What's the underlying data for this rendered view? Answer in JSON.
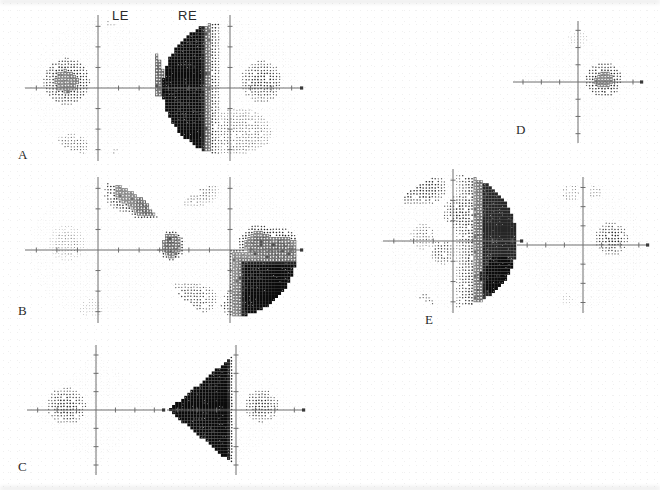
{
  "figure": {
    "type": "visual-field-greyscale-grid",
    "background": "#ffffff",
    "ink": "#1a1a1a",
    "column_headers": [
      {
        "label": "LE",
        "x": 112,
        "y": 8
      },
      {
        "label": "RE",
        "x": 178,
        "y": 8
      }
    ],
    "panels": [
      {
        "id": "A",
        "letter": "A",
        "letter_x": 18,
        "letter_y": 147,
        "fields": [
          {
            "eye": "LE",
            "x": 24,
            "y": 14,
            "w": 148,
            "h": 148,
            "shape": "round",
            "overall": "near-normal",
            "blind_spot": {
              "cx": -14,
              "cy": -3,
              "r": 9,
              "level": 7
            },
            "defects": [
              {
                "kind": "patch",
                "cx": -12,
                "cy": 26,
                "rx": 7,
                "ry": 5,
                "level": 4
              },
              {
                "kind": "band",
                "x0": 26,
                "x1": 32,
                "y0": -16,
                "y1": 4,
                "level": 8
              },
              {
                "kind": "speck",
                "cx": 8,
                "cy": 28,
                "r": 2,
                "level": 3
              },
              {
                "kind": "speck",
                "cx": 6,
                "cy": -29,
                "r": 2,
                "level": 3
              }
            ]
          },
          {
            "eye": "RE",
            "x": 156,
            "y": 14,
            "w": 148,
            "h": 148,
            "shape": "round",
            "overall": "dense-temporal-hemianopia",
            "blind_spot": {
              "cx": 14,
              "cy": -3,
              "r": 8,
              "level": 6
            },
            "defects": [
              {
                "kind": "hemi",
                "side": "left",
                "edge": -4,
                "level": 10,
                "feather": 9
              },
              {
                "kind": "patch",
                "cx": 4,
                "cy": 20,
                "rx": 13,
                "ry": 10,
                "level": 4
              },
              {
                "kind": "speck",
                "cx": -9,
                "cy": -29,
                "r": 4,
                "level": 6
              }
            ]
          }
        ]
      },
      {
        "id": "B",
        "letter": "B",
        "letter_x": 18,
        "letter_y": 303,
        "fields": [
          {
            "eye": "LE",
            "x": 24,
            "y": 176,
            "w": 148,
            "h": 148,
            "shape": "round",
            "overall": "inferior-temporal-defect",
            "blind_spot": {
              "cx": -14,
              "cy": -3,
              "r": 7,
              "level": 3
            },
            "defects": [
              {
                "kind": "patch",
                "cx": 16,
                "cy": -26,
                "rx": 12,
                "ry": 9,
                "level": 7
              },
              {
                "kind": "patch",
                "cx": 22,
                "cy": -20,
                "rx": 8,
                "ry": 6,
                "level": 8
              },
              {
                "kind": "speck",
                "cx": -3,
                "cy": 27,
                "r": 5,
                "level": 2
              }
            ]
          },
          {
            "eye": "RE",
            "x": 156,
            "y": 176,
            "w": 148,
            "h": 148,
            "shape": "round",
            "overall": "inferior-and-nasal-quadrant-loss",
            "blind_spot": {
              "cx": 13,
              "cy": -2,
              "r": 8,
              "level": 8
            },
            "defects": [
              {
                "kind": "quad",
                "qx": "right",
                "qy": "bottom",
                "level": 10
              },
              {
                "kind": "patch",
                "cx": 22,
                "cy": 6,
                "rx": 13,
                "ry": 14,
                "level": 8
              },
              {
                "kind": "patch",
                "cx": 14,
                "cy": 24,
                "rx": 16,
                "ry": 9,
                "level": 7
              },
              {
                "kind": "patch",
                "cx": -18,
                "cy": 22,
                "rx": 11,
                "ry": 7,
                "level": 5
              },
              {
                "kind": "patch",
                "cx": -26,
                "cy": -2,
                "rx": 5,
                "ry": 6,
                "level": 8
              },
              {
                "kind": "patch",
                "cx": -16,
                "cy": -26,
                "rx": 10,
                "ry": 6,
                "level": 4
              }
            ]
          }
        ]
      },
      {
        "id": "C",
        "letter": "C",
        "letter_x": 18,
        "letter_y": 459,
        "fields": [
          {
            "eye": "LE",
            "x": 26,
            "y": 344,
            "w": 140,
            "h": 132,
            "shape": "diamond",
            "overall": "normal",
            "blind_spot": {
              "cx": -14,
              "cy": -2,
              "r": 8,
              "level": 6
            },
            "defects": []
          },
          {
            "eye": "RE",
            "x": 166,
            "y": 344,
            "w": 140,
            "h": 132,
            "shape": "diamond",
            "overall": "dense-temporal-hemianopia",
            "blind_spot": {
              "cx": 12,
              "cy": -2,
              "r": 7,
              "level": 6
            },
            "defects": [
              {
                "kind": "hemi",
                "side": "left",
                "edge": -1,
                "level": 10,
                "feather": 3
              }
            ]
          }
        ]
      },
      {
        "id": "D",
        "letter": "D",
        "letter_x": 516,
        "letter_y": 122,
        "fields": [
          {
            "eye": "RE",
            "x": 512,
            "y": 20,
            "w": 132,
            "h": 124,
            "shape": "diamond",
            "overall": "normal",
            "blind_spot": {
              "cx": 13,
              "cy": -1,
              "r": 8,
              "level": 7
            },
            "defects": [
              {
                "kind": "speck",
                "cx": 0,
                "cy": -24,
                "r": 5,
                "level": 2
              }
            ]
          }
        ]
      },
      {
        "id": "E",
        "letter": "E",
        "letter_x": 425,
        "letter_y": 312,
        "fields": [
          {
            "eye": "LE",
            "x": 382,
            "y": 168,
            "w": 142,
            "h": 146,
            "shape": "round",
            "overall": "dense-nasal-hemianopia",
            "blind_spot": {
              "cx": -14,
              "cy": -2,
              "r": 5,
              "level": 4
            },
            "defects": [
              {
                "kind": "hemi",
                "side": "right",
                "edge": 1,
                "level": 9,
                "feather": 14
              },
              {
                "kind": "patch",
                "cx": 10,
                "cy": -13,
                "rx": 13,
                "ry": 9,
                "level": 6
              },
              {
                "kind": "patch",
                "cx": 22,
                "cy": 16,
                "rx": 11,
                "ry": 14,
                "level": 10
              },
              {
                "kind": "patch",
                "cx": -16,
                "cy": -24,
                "rx": 12,
                "ry": 7,
                "level": 6
              },
              {
                "kind": "patch",
                "cx": -5,
                "cy": 5,
                "rx": 5,
                "ry": 5,
                "level": 5
              },
              {
                "kind": "speck",
                "cx": -13,
                "cy": 28,
                "r": 4,
                "level": 4
              }
            ]
          },
          {
            "eye": "RE",
            "x": 516,
            "y": 176,
            "w": 134,
            "h": 138,
            "shape": "round",
            "overall": "near-normal",
            "blind_spot": {
              "cx": 14,
              "cy": -3,
              "r": 7,
              "level": 6
            },
            "defects": [
              {
                "kind": "speck",
                "cx": -6,
                "cy": -25,
                "r": 4,
                "level": 3
              },
              {
                "kind": "speck",
                "cx": 6,
                "cy": -25,
                "r": 3,
                "level": 3
              },
              {
                "kind": "speck",
                "cx": -8,
                "cy": 26,
                "r": 3,
                "level": 2
              }
            ]
          }
        ]
      }
    ],
    "greyscale_levels": {
      "count": 11,
      "swatches": [
        "#ffffff",
        "#f2f2f2",
        "#e4e4e4",
        "#d2d2d2",
        "#bdbdbd",
        "#a3a3a3",
        "#868686",
        "#666666",
        "#454545",
        "#262626",
        "#0b0b0b"
      ]
    },
    "axis": {
      "color": "#6e6e6e",
      "tick_count_per_arm": 3,
      "end_marker": "square"
    }
  }
}
